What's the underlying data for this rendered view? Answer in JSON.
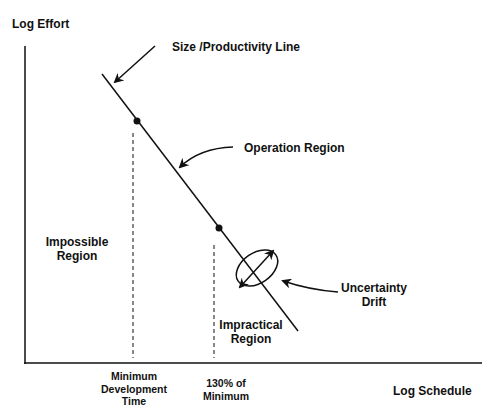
{
  "diagram": {
    "y_axis_label": "Log Effort",
    "x_axis_label": "Log Schedule",
    "line_label": "Size /Productivity Line",
    "operation_region": "Operation Region",
    "impossible_region": [
      "Impossible",
      "Region"
    ],
    "impractical_region": [
      "Impractical",
      "Region"
    ],
    "uncertainty": [
      "Uncertainty",
      "Drift"
    ],
    "tick_min": [
      "Minimum",
      "Development",
      "Time"
    ],
    "tick_130": [
      "130% of",
      "Minimum"
    ],
    "colors": {
      "ink": "#111111",
      "background": "#ffffff"
    }
  }
}
